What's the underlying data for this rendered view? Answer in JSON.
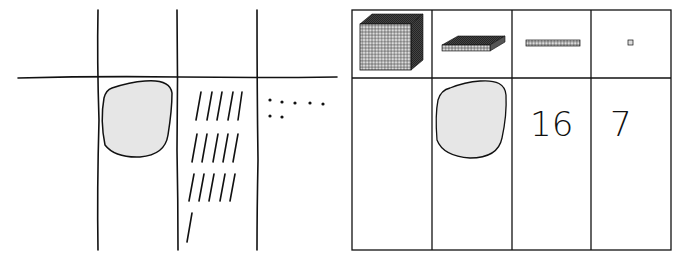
{
  "left_diagram": {
    "description": "Hand-drawn place value mat with a blob in hundreds column, tally sticks in tens column and dots in ones column",
    "columns": [
      "blank",
      "blob",
      "tens-sticks",
      "ones-dots"
    ],
    "tens_sticks_count": 16,
    "ones_dots_count": 7,
    "blob_fill": "#e6e6e6"
  },
  "right_diagram": {
    "description": "Place value chart with base-ten block headers",
    "headers": [
      "thousands-cube",
      "hundreds-flat",
      "tens-rod",
      "ones-unit"
    ],
    "values": [
      "",
      "blob",
      "16",
      "7"
    ],
    "tens_value": "16",
    "ones_value": "7",
    "blob_fill": "#e6e6e6"
  }
}
